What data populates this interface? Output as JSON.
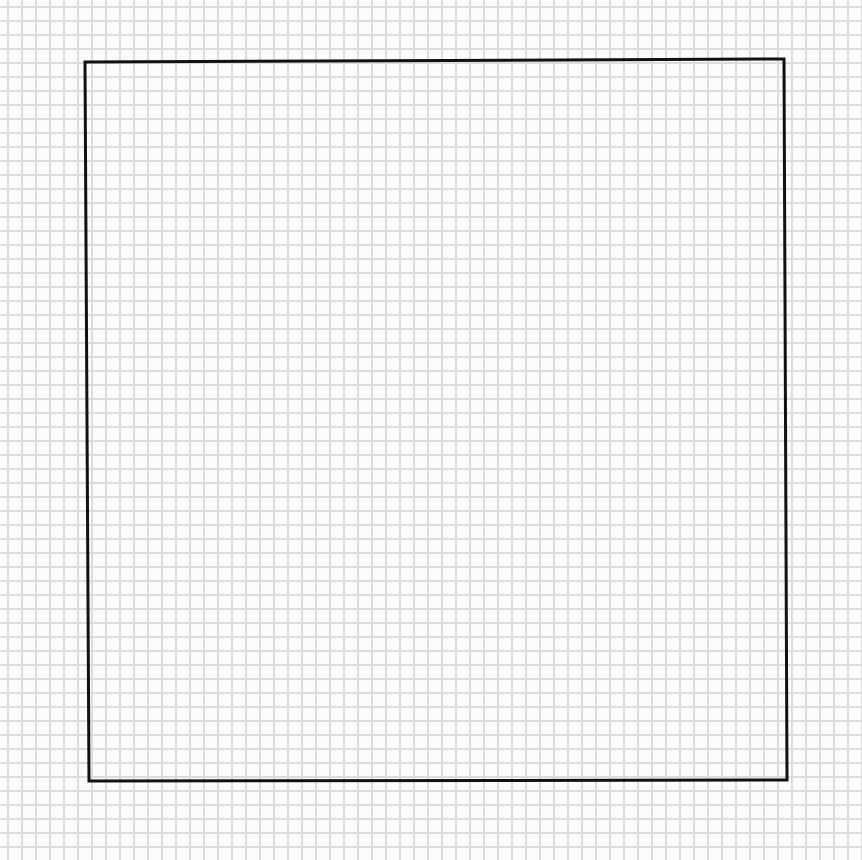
{
  "canvas": {
    "background": "grid-paper",
    "grid_color": "#dcdcdc",
    "paper_color": "#fcfcfc",
    "grid_spacing_px": 14
  },
  "drawing": {
    "shape": "square",
    "style": "hand-drawn",
    "stroke_color": "#111111",
    "stroke_width": 3,
    "fill": "none",
    "corners": [
      [
        85,
        62
      ],
      [
        784,
        59
      ],
      [
        787,
        780
      ],
      [
        89,
        781
      ]
    ]
  },
  "text": {}
}
